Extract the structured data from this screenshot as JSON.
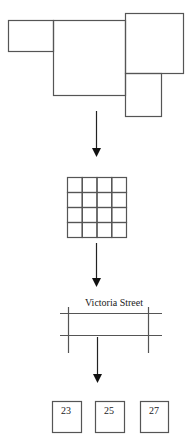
{
  "diagram": {
    "stages": [
      {
        "name": "building-footprints",
        "description": "Irregular arrangement of building outlines"
      },
      {
        "name": "grid",
        "rows": 4,
        "cols": 4
      },
      {
        "name": "street-map",
        "street_label": "Victoria Street"
      },
      {
        "name": "house-numbers",
        "houses": [
          "23",
          "25",
          "27"
        ]
      }
    ],
    "street_label": "Victoria Street",
    "houses": [
      "23",
      "25",
      "27"
    ]
  }
}
